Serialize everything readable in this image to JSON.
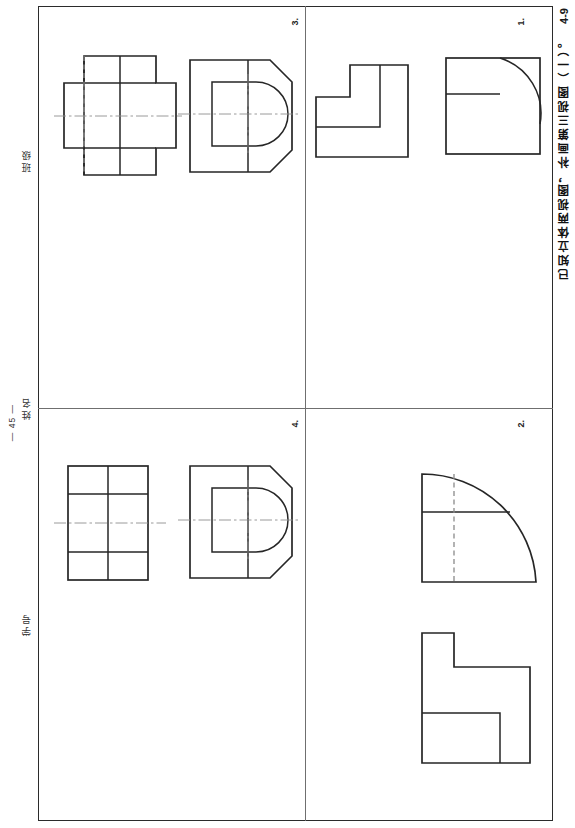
{
  "sheet": {
    "code": "4-9",
    "title": "已知立体两视图，补画第三视图（一）。",
    "page_number": "— 45 —"
  },
  "side_labels": {
    "class": "班级",
    "name": "姓名",
    "student_id": "学号"
  },
  "quadrants": [
    {
      "id": "q1",
      "number": "1.",
      "position": "top-right",
      "views": [
        {
          "name": "stepped-block-front-view",
          "type": "outline-polygon",
          "description": "L-shaped stepped block profile with internal step line"
        },
        {
          "name": "square-with-quarter-arc-view",
          "type": "outline-with-arc",
          "description": "Square outline containing a quarter circle arc and a horizontal division line"
        }
      ]
    },
    {
      "id": "q2",
      "number": "2.",
      "position": "bottom-right",
      "views": [
        {
          "name": "quarter-round-view",
          "type": "outline-with-arc",
          "description": "Quarter round shape with horizontal division line and vertical hidden dashed line"
        },
        {
          "name": "stepped-profile-view",
          "type": "outline-polygon",
          "description": "Stepped L-shaped profile with notch at top-left and internal rectangle"
        }
      ]
    },
    {
      "id": "q3",
      "number": "3.",
      "position": "top-left",
      "views": [
        {
          "name": "cross-shaped-top-view",
          "type": "outline-polygon",
          "description": "Cross/plus shaped view with horizontal centerline and vertical hidden dashed line"
        },
        {
          "name": "octagon-with-d-slot-view",
          "type": "outline-with-arc",
          "description": "Octagonal outline with D-shaped inner feature and horizontal and vertical centerlines"
        }
      ]
    },
    {
      "id": "q4",
      "number": "4.",
      "position": "bottom-left",
      "views": [
        {
          "name": "gridded-rectangle-view",
          "type": "outline-polygon",
          "description": "Rectangle divided into a 2 by 4 grid with horizontal centerline"
        },
        {
          "name": "octagon-with-d-slot-view",
          "type": "outline-with-arc",
          "description": "Octagonal outline with D-shaped inner feature and centerlines"
        }
      ]
    }
  ]
}
